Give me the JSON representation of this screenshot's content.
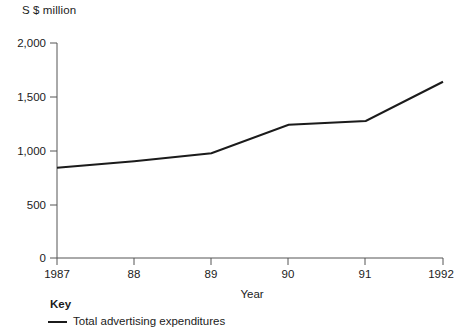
{
  "chart_data": {
    "type": "line",
    "title": "",
    "unit_label": "S $ million",
    "xlabel": "Year",
    "ylabel": "",
    "categories": [
      "1987",
      "88",
      "89",
      "90",
      "91",
      "1992"
    ],
    "x": [
      1987,
      1988,
      1989,
      1990,
      1991,
      1992
    ],
    "series": [
      {
        "name": "Total advertising expenditures",
        "values": [
          840,
          900,
          975,
          1240,
          1275,
          1640
        ],
        "color": "#1b1b1b"
      }
    ],
    "ylim": [
      0,
      2000
    ],
    "yticks": [
      0,
      500,
      1000,
      1500,
      2000
    ],
    "ytick_labels": [
      "0",
      "500",
      "1,000",
      "1,500",
      "2,000"
    ],
    "xtick_labels": [
      "1987",
      "88",
      "89",
      "90",
      "91",
      "1992"
    ],
    "grid": false,
    "legend_position": "below-left",
    "legend_title": "Key"
  },
  "axes": {
    "unit_title": "S $ million",
    "x_axis_title": "Year",
    "y_tick_labels": [
      "2,000",
      "1,500",
      "1,000",
      "500",
      "0"
    ],
    "x_tick_labels": [
      "1987",
      "88",
      "89",
      "90",
      "91",
      "1992"
    ]
  },
  "legend": {
    "heading": "Key",
    "entries": [
      {
        "label": "Total advertising expenditures"
      }
    ]
  },
  "colors": {
    "line": "#1b1b1b",
    "axis": "#555555",
    "text": "#1b1b1b",
    "background": "#ffffff"
  }
}
